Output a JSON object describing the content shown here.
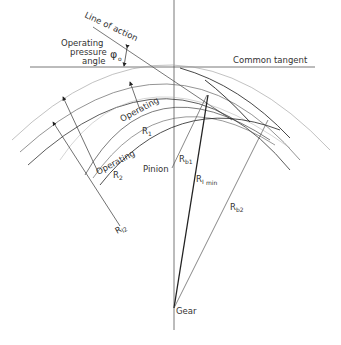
{
  "labels": {
    "line_of_action": "Line of action",
    "operating_pressure_angle_1": "Operating",
    "operating_pressure_angle_2": "pressure",
    "operating_pressure_angle_3": "angle",
    "phi": "φ",
    "phi_sub": "o",
    "common_tangent": "Common tangent",
    "operating_r1_1": "Operating",
    "operating_r1_2": "R",
    "operating_r1_sub": "1",
    "operating_r2_1": "Operating",
    "operating_r2_2": "R",
    "operating_r2_sub": "2",
    "pinion": "Pinion",
    "rb1": "R",
    "rb1_sub": "b1",
    "rimin": "R",
    "rimin_sub": "I",
    "rimin_sub2": "min",
    "rb2": "R",
    "rb2_sub": "b2",
    "ri2": "R",
    "ri2_sub": "I2",
    "gear": "Gear"
  },
  "colors": {
    "line": "#333333",
    "light_line": "#888888",
    "background": "#ffffff"
  }
}
